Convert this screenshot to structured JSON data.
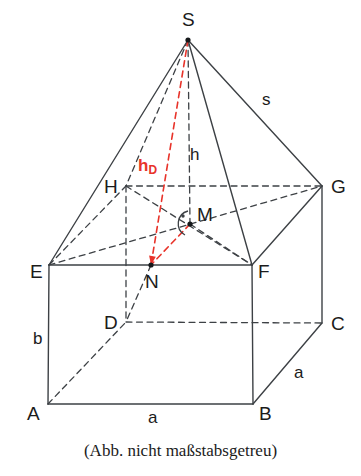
{
  "figure": {
    "caption": "(Abb. nicht maßstabsgetreu)",
    "colors": {
      "stroke": "#3d4145",
      "accent_red": "#e8332a",
      "text": "#1b1b1b",
      "background": "#ffffff"
    },
    "vertices": [
      {
        "name": "S",
        "label": "S",
        "x": 188,
        "y": 40,
        "label_x": 182,
        "label_y": 10,
        "dot": true
      },
      {
        "name": "H",
        "label": "H",
        "x": 126,
        "y": 186,
        "label_x": 104,
        "label_y": 177,
        "dot": false
      },
      {
        "name": "G",
        "label": "G",
        "x": 322,
        "y": 186,
        "label_x": 331,
        "label_y": 177,
        "dot": false
      },
      {
        "name": "M",
        "label": "M",
        "x": 190,
        "y": 224,
        "label_x": 197,
        "label_y": 205,
        "dot": true
      },
      {
        "name": "E",
        "label": "E",
        "x": 49,
        "y": 265,
        "label_x": 30,
        "label_y": 262,
        "dot": false
      },
      {
        "name": "F",
        "label": "F",
        "x": 252,
        "y": 265,
        "label_x": 258,
        "label_y": 262,
        "dot": false
      },
      {
        "name": "N",
        "label": "N",
        "x": 151,
        "y": 265,
        "label_x": 145,
        "label_y": 272,
        "dot": true
      },
      {
        "name": "D",
        "label": "D",
        "x": 126,
        "y": 322,
        "label_x": 104,
        "label_y": 313,
        "dot": false
      },
      {
        "name": "C",
        "label": "C",
        "x": 322,
        "y": 323,
        "label_x": 331,
        "label_y": 314,
        "dot": false
      },
      {
        "name": "A",
        "label": "A",
        "x": 48,
        "y": 404,
        "label_x": 27,
        "label_y": 404,
        "dot": false
      },
      {
        "name": "B",
        "label": "B",
        "x": 253,
        "y": 404,
        "label_x": 259,
        "label_y": 404,
        "dot": false
      }
    ],
    "edge_labels": [
      {
        "name": "slant-edge-label",
        "text": "s",
        "x": 262,
        "y": 91,
        "style": "black"
      },
      {
        "name": "height-label",
        "text": "h",
        "x": 190,
        "y": 146,
        "style": "black"
      },
      {
        "name": "apothem-label",
        "text": "h",
        "sub": "D",
        "x": 138,
        "y": 157,
        "style": "red"
      },
      {
        "name": "base-width-label",
        "text": "a",
        "x": 148,
        "y": 409,
        "style": "black"
      },
      {
        "name": "base-depth-label",
        "text": "a",
        "x": 294,
        "y": 364,
        "style": "black"
      },
      {
        "name": "height-b-label",
        "text": "b",
        "x": 33,
        "y": 330,
        "style": "black"
      }
    ],
    "solid_edges": [
      {
        "name": "edge-S-E",
        "from": "S",
        "to": "E"
      },
      {
        "name": "edge-S-F",
        "from": "S",
        "to": "F"
      },
      {
        "name": "edge-S-G",
        "from": "S",
        "to": "G"
      },
      {
        "name": "edge-E-F",
        "from": "E",
        "to": "F"
      },
      {
        "name": "edge-F-G",
        "from": "F",
        "to": "G"
      },
      {
        "name": "edge-E-A",
        "from": "E",
        "to": "A"
      },
      {
        "name": "edge-F-B",
        "from": "F",
        "to": "B"
      },
      {
        "name": "edge-G-C",
        "from": "G",
        "to": "C"
      },
      {
        "name": "edge-A-B",
        "from": "A",
        "to": "B"
      },
      {
        "name": "edge-B-C",
        "from": "B",
        "to": "C"
      }
    ],
    "dashed_edges": [
      {
        "name": "edge-S-H",
        "from": "S",
        "to": "H"
      },
      {
        "name": "edge-S-M",
        "from": "S",
        "to": "M"
      },
      {
        "name": "edge-H-G",
        "from": "H",
        "to": "G"
      },
      {
        "name": "edge-E-H",
        "from": "E",
        "to": "H"
      },
      {
        "name": "edge-E-G",
        "from": "E",
        "to": "G"
      },
      {
        "name": "edge-H-F",
        "from": "H",
        "to": "F"
      },
      {
        "name": "edge-M-F",
        "from": "M",
        "to": "F"
      },
      {
        "name": "edge-H-D",
        "from": "H",
        "to": "D"
      },
      {
        "name": "edge-D-C",
        "from": "D",
        "to": "C"
      },
      {
        "name": "edge-A-D",
        "from": "A",
        "to": "D"
      },
      {
        "name": "edge-N-D",
        "from": "N",
        "to": "D"
      }
    ],
    "red_edges": [
      {
        "name": "apothem-S-N",
        "from": "S",
        "to": "N"
      },
      {
        "name": "apothem-M-N",
        "from": "M",
        "to": "N"
      }
    ],
    "right_angle": {
      "name": "right-angle-marker-M",
      "at": "M"
    }
  }
}
